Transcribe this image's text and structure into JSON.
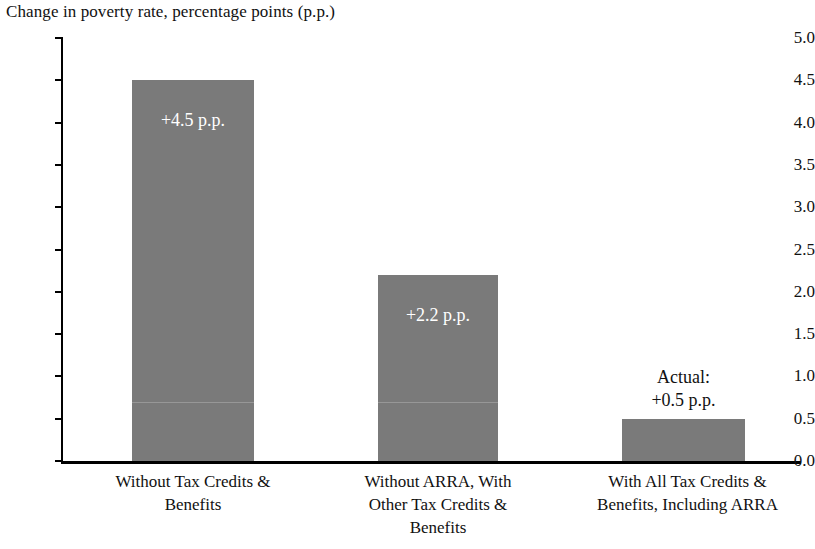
{
  "chart_data": {
    "type": "bar",
    "title": "Change in poverty rate, percentage points (p.p.)",
    "xlabel": "",
    "ylabel": "Change in poverty rate, percentage points (p.p.)",
    "ylim": [
      0.0,
      5.0
    ],
    "ytick_step": 0.5,
    "grid": false,
    "legend": "none",
    "bar_color": "#7a7a7a",
    "categories": [
      "Without Tax Credits & Benefits",
      "Without ARRA, With Other Tax Credits & Benefits",
      "With All Tax Credits & Benefits, Including ARRA"
    ],
    "values": [
      4.5,
      2.2,
      0.5
    ],
    "tick_labels": [
      "5.0",
      "4.5",
      "4.0",
      "3.5",
      "3.0",
      "2.5",
      "2.0",
      "1.5",
      "1.0",
      "0.5",
      "0.0"
    ],
    "tick_values": [
      5.0,
      4.5,
      4.0,
      3.5,
      3.0,
      2.5,
      2.0,
      1.5,
      1.0,
      0.5,
      0.0
    ],
    "bars": [
      {
        "category_lines": [
          "Without Tax Credits &",
          "Benefits"
        ],
        "value": 4.5,
        "data_label": "+4.5 p.p.",
        "label_position": "inside",
        "label_color": "#ffffff"
      },
      {
        "category_lines": [
          "Without ARRA, With",
          "Other Tax Credits &",
          "Benefits"
        ],
        "value": 2.2,
        "data_label": "+2.2 p.p.",
        "label_position": "inside",
        "label_color": "#ffffff"
      },
      {
        "category_lines": [
          "With All Tax Credits &",
          "Benefits, Including ARRA"
        ],
        "value": 0.5,
        "data_label": "+0.5 p.p.",
        "data_label_prefix": "Actual:",
        "label_position": "above",
        "label_color": "#111111"
      }
    ]
  }
}
